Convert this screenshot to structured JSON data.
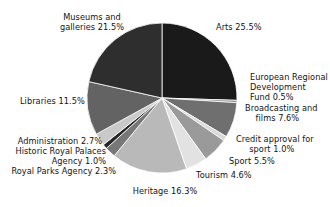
{
  "chart_data": {
    "type": "pie",
    "title": "",
    "subtitle": "",
    "xlabel": "",
    "ylabel": "",
    "legend_position": "none",
    "grid": false,
    "units": "percent",
    "start_angle_deg": 0,
    "direction": "clockwise",
    "categories": [
      "Arts",
      "European Regional Development Fund",
      "Broadcasting and films",
      "Credit approval for sport",
      "Sport",
      "Tourism",
      "Heritage",
      "Royal Parks Agency",
      "Historic Royal Palaces Agency",
      "Administration",
      "Libraries",
      "Museums and galleries"
    ],
    "values": [
      25.5,
      0.5,
      7.6,
      1.0,
      5.5,
      4.6,
      16.3,
      2.3,
      1.0,
      2.7,
      11.5,
      21.5
    ],
    "colors": [
      "#1a1a1a",
      "#8f8f8f",
      "#6f6f6f",
      "#d8d8d8",
      "#9a9a9a",
      "#e2e2e2",
      "#b9b9b9",
      "#777777",
      "#252525",
      "#c9c9c9",
      "#636363",
      "#2e2e2e"
    ],
    "slices": [
      {
        "label": "Arts",
        "value": 25.5,
        "color": "#1a1a1a"
      },
      {
        "label": "European Regional Development Fund",
        "value": 0.5,
        "color": "#8f8f8f"
      },
      {
        "label": "Broadcasting and films",
        "value": 7.6,
        "color": "#6f6f6f"
      },
      {
        "label": "Credit approval for sport",
        "value": 1.0,
        "color": "#d8d8d8"
      },
      {
        "label": "Sport",
        "value": 5.5,
        "color": "#9a9a9a"
      },
      {
        "label": "Tourism",
        "value": 4.6,
        "color": "#e2e2e2"
      },
      {
        "label": "Heritage",
        "value": 16.3,
        "color": "#b9b9b9"
      },
      {
        "label": "Royal Parks Agency",
        "value": 2.3,
        "color": "#777777"
      },
      {
        "label": "Historic Royal Palaces Agency",
        "value": 1.0,
        "color": "#252525"
      },
      {
        "label": "Administration",
        "value": 2.7,
        "color": "#c9c9c9"
      },
      {
        "label": "Libraries",
        "value": 11.5,
        "color": "#636363"
      },
      {
        "label": "Museums and galleries",
        "value": 21.5,
        "color": "#2e2e2e"
      }
    ]
  },
  "labels": {
    "museums": "Museums and\ngalleries 21.5%",
    "arts": "Arts 25.5%",
    "erdf": "European Regional\nDevelopment\nFund 0.5%",
    "broadcasting": "Broadcasting and\n    films 7.6%",
    "credit": "Credit approval for\n     sport 1.0%",
    "sport": "Sport 5.5%",
    "tourism": "Tourism 4.6%",
    "heritage": "Heritage 16.3%",
    "libraries": "Libraries 11.5%",
    "administration": "Administration 2.7%",
    "historic_royal_palaces": "Historic Royal Palaces\nAgency 1.0%",
    "royal_parks": "Royal Parks Agency 2.3%"
  },
  "style": {
    "background": "#ffffff",
    "text_color": "#131313",
    "slice_outline": "#ffffff"
  }
}
